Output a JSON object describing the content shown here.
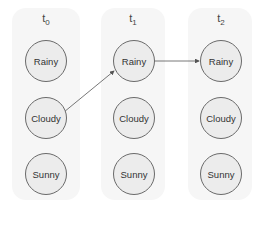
{
  "diagram": {
    "title": "",
    "columns": [
      {
        "label": "t",
        "sub": "0",
        "states": [
          "Rainy",
          "Cloudy",
          "Sunny"
        ]
      },
      {
        "label": "t",
        "sub": "1",
        "states": [
          "Rainy",
          "Cloudy",
          "Sunny"
        ]
      },
      {
        "label": "t",
        "sub": "2",
        "states": [
          "Rainy",
          "Cloudy",
          "Sunny"
        ]
      }
    ],
    "edges": [
      {
        "from": "t0.Cloudy",
        "to": "t1.Rainy"
      },
      {
        "from": "t1.Rainy",
        "to": "t2.Rainy"
      }
    ],
    "colors": {
      "panel": "#f6f6f6",
      "node_fill": "#ececec",
      "node_stroke": "#6a6a6a",
      "edge": "#555555"
    }
  }
}
